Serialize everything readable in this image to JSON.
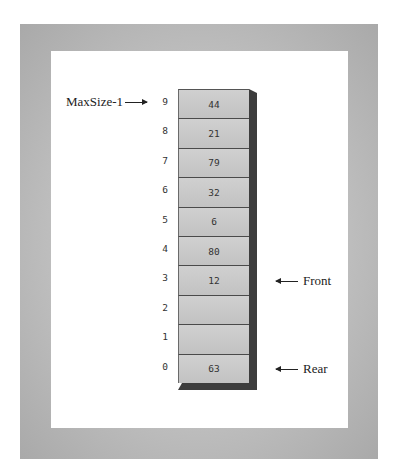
{
  "diagram": {
    "type": "array-based queue",
    "cells": [
      {
        "index": "9",
        "value": "44"
      },
      {
        "index": "8",
        "value": "21"
      },
      {
        "index": "7",
        "value": "79"
      },
      {
        "index": "6",
        "value": "32"
      },
      {
        "index": "5",
        "value": "6"
      },
      {
        "index": "4",
        "value": "80"
      },
      {
        "index": "3",
        "value": "12"
      },
      {
        "index": "2",
        "value": ""
      },
      {
        "index": "1",
        "value": ""
      },
      {
        "index": "0",
        "value": "63"
      }
    ],
    "pointers": {
      "maxsize": {
        "label": "MaxSize-1",
        "points_to_index": "9"
      },
      "front": {
        "label": "Front",
        "points_to_index": "3"
      },
      "rear": {
        "label": "Rear",
        "points_to_index": "0"
      }
    },
    "colors": {
      "frame": "#bdbdbd",
      "panel": "#ffffff",
      "cell": "#c8c8c8",
      "shadow": "#3d3d3d",
      "text": "#222222"
    }
  }
}
